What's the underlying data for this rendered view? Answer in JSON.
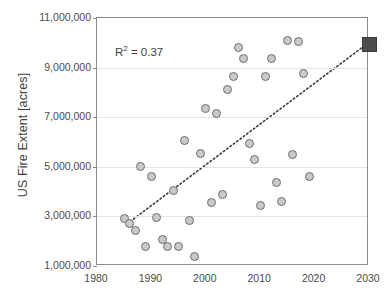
{
  "chart_data": {
    "type": "scatter",
    "title": "",
    "xlabel": "",
    "ylabel": "US Fire Extent [acres]",
    "xlim": [
      1980,
      2030
    ],
    "ylim": [
      1000000,
      11000000
    ],
    "grid": true,
    "legend": "none",
    "xticks": [
      1980,
      1990,
      2000,
      2010,
      2020,
      2030
    ],
    "xtick_labels": [
      "1980",
      "1990",
      "2000",
      "2010",
      "2020",
      "2030"
    ],
    "yticks": [
      1000000,
      3000000,
      5000000,
      7000000,
      9000000,
      11000000
    ],
    "ytick_labels": [
      "1,000,000",
      "3,000,000",
      "5,000,000",
      "7,000,000",
      "9,000,000",
      "11,000,000"
    ],
    "annotations": [
      {
        "text": "R² = 0.37",
        "r2_value": 0.37
      }
    ],
    "series": [
      {
        "name": "US Fire Extent observations",
        "marker": "circle",
        "color": "#c9c9c9",
        "edge_color": "#6e6e6e",
        "points": [
          {
            "x": 1985,
            "y": 2900000
          },
          {
            "x": 1986,
            "y": 2700000
          },
          {
            "x": 1987,
            "y": 2450000
          },
          {
            "x": 1988,
            "y": 5000000
          },
          {
            "x": 1989,
            "y": 1800000
          },
          {
            "x": 1990,
            "y": 4600000
          },
          {
            "x": 1991,
            "y": 2950000
          },
          {
            "x": 1992,
            "y": 2050000
          },
          {
            "x": 1993,
            "y": 1800000
          },
          {
            "x": 1994,
            "y": 4050000
          },
          {
            "x": 1995,
            "y": 1800000
          },
          {
            "x": 1996,
            "y": 6050000
          },
          {
            "x": 1997,
            "y": 2850000
          },
          {
            "x": 1998,
            "y": 1400000
          },
          {
            "x": 1999,
            "y": 5550000
          },
          {
            "x": 2000,
            "y": 7350000
          },
          {
            "x": 2001,
            "y": 3550000
          },
          {
            "x": 2002,
            "y": 7150000
          },
          {
            "x": 2003,
            "y": 3900000
          },
          {
            "x": 2004,
            "y": 8100000
          },
          {
            "x": 2005,
            "y": 8650000
          },
          {
            "x": 2006,
            "y": 9800000
          },
          {
            "x": 2007,
            "y": 9350000
          },
          {
            "x": 2008,
            "y": 5950000
          },
          {
            "x": 2009,
            "y": 5300000
          },
          {
            "x": 2010,
            "y": 3450000
          },
          {
            "x": 2011,
            "y": 8650000
          },
          {
            "x": 2012,
            "y": 9350000
          },
          {
            "x": 2013,
            "y": 4350000
          },
          {
            "x": 2014,
            "y": 3600000
          },
          {
            "x": 2015,
            "y": 10100000
          },
          {
            "x": 2016,
            "y": 5500000
          },
          {
            "x": 2017,
            "y": 10050000
          },
          {
            "x": 2018,
            "y": 8750000
          },
          {
            "x": 2019,
            "y": 4600000
          }
        ]
      },
      {
        "name": "Projection",
        "marker": "square",
        "color": "#4d4d4d",
        "points": [
          {
            "x": 2030,
            "y": 9950000
          }
        ]
      }
    ],
    "trendline": {
      "style": "dotted",
      "color": "#3a3a3a",
      "x_start": 1985.5,
      "y_start": 2620000,
      "x_end": 2030,
      "y_end": 9950000
    }
  }
}
